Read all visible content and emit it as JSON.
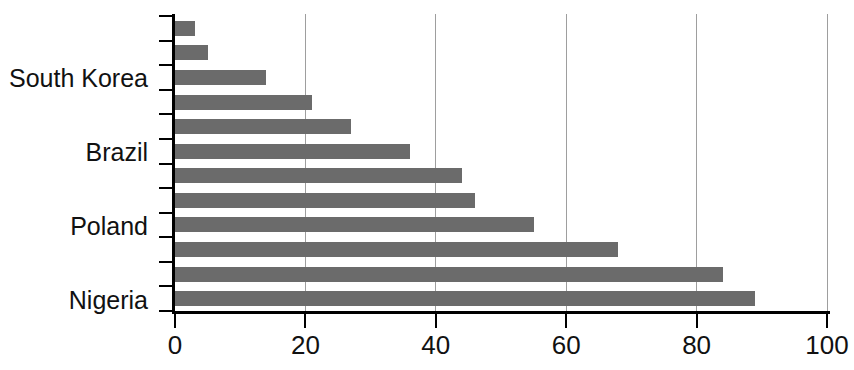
{
  "chart_data": {
    "type": "bar",
    "orientation": "horizontal",
    "title": "",
    "xlabel": "",
    "ylabel": "",
    "xlim": [
      0,
      100
    ],
    "x_ticks": [
      "0",
      "20",
      "40",
      "60",
      "80",
      "100"
    ],
    "x_tick_values": [
      0,
      20,
      40,
      60,
      80,
      100
    ],
    "grid": "vertical-gridlines-at-x-ticks",
    "legend": "none",
    "bars": [
      {
        "label": "",
        "value": 3
      },
      {
        "label": "",
        "value": 5
      },
      {
        "label": "South Korea",
        "value": 14
      },
      {
        "label": "",
        "value": 21
      },
      {
        "label": "",
        "value": 27
      },
      {
        "label": "Brazil",
        "value": 36
      },
      {
        "label": "",
        "value": 44
      },
      {
        "label": "",
        "value": 46
      },
      {
        "label": "Poland",
        "value": 55
      },
      {
        "label": "",
        "value": 68
      },
      {
        "label": "",
        "value": 84
      },
      {
        "label": "Nigeria",
        "value": 89
      }
    ],
    "labeled_categories": [
      "South Korea",
      "Brazil",
      "Poland",
      "Nigeria"
    ],
    "colors": {
      "bar": "#6b6b6b",
      "gridline": "#9e9e9e",
      "axis": "#000000",
      "text": "#111111",
      "background": "#ffffff"
    }
  }
}
